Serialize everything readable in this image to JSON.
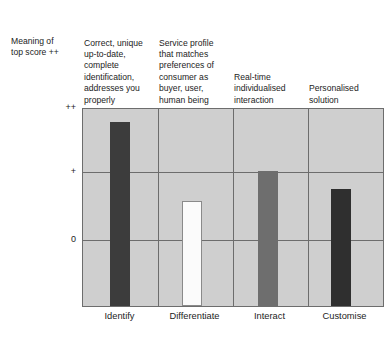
{
  "chart_data": {
    "type": "bar",
    "title": "",
    "subtitle": "",
    "xlabel": "",
    "ylabel": "Meaning of top score ++",
    "categories": [
      "Identify",
      "Differentiate",
      "Interact",
      "Customise"
    ],
    "values": [
      1.77,
      0.59,
      1.03,
      0.76
    ],
    "ytick_labels": [
      "++",
      "+",
      "0"
    ],
    "ytick_values": [
      2,
      1,
      0
    ],
    "ylim": [
      -1,
      2
    ],
    "grid": true,
    "legend": "none",
    "series": [
      {
        "name": "Meaning of top score",
        "values": [
          1.77,
          0.59,
          1.03,
          0.76
        ]
      }
    ],
    "bar_colors": [
      "#3c3c3c",
      "#fbfbfb",
      "#6e6e6e",
      "#2f2f2f"
    ],
    "plot_background": "#cfcfcf",
    "axis_color": "#6d6d6d",
    "annotations": [
      "Correct, unique up-to-date, complete identification, addresses you properly",
      "Service profile that matches preferences of consumer as buyer, user, human being",
      "Real-time individualised interaction",
      "Personalised solution"
    ]
  },
  "axis_caption": {
    "meaning_label": "Meaning of\ntop score ++"
  },
  "column_headers": [
    {
      "text": "Correct, unique\nup-to-date,\ncomplete\nidentification,\naddresses you\nproperly"
    },
    {
      "text": "Service profile\nthat matches\npreferences of\nconsumer as\nbuyer, user,\nhuman being"
    },
    {
      "text": "Real-time\nindividualised\ninteraction"
    },
    {
      "text": "Personalised\nsolution"
    }
  ],
  "y_axis": {
    "ticks": [
      {
        "label": "++"
      },
      {
        "label": "+"
      },
      {
        "label": "0"
      }
    ]
  },
  "x_axis": {
    "ticks": [
      {
        "label": "Identify"
      },
      {
        "label": "Differentiate"
      },
      {
        "label": "Interact"
      },
      {
        "label": "Customise"
      }
    ]
  }
}
